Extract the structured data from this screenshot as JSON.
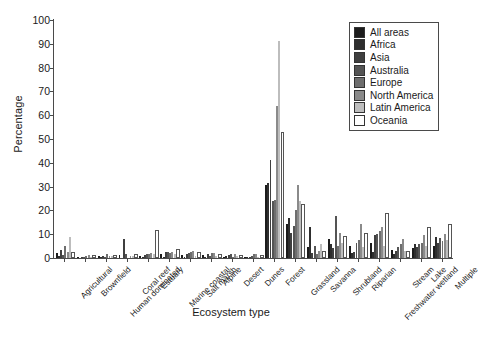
{
  "chart_data": {
    "type": "bar",
    "title": "",
    "xlabel": "Ecosystem type",
    "ylabel": "Percentage",
    "ylim": [
      0,
      100
    ],
    "ytick_step": 10,
    "yticks": [
      0,
      10,
      20,
      30,
      40,
      50,
      60,
      70,
      80,
      90,
      100
    ],
    "grid": false,
    "legend_position": "top-right",
    "categories": [
      "Agricultural",
      "Brownfield",
      "Human dominated",
      "Coral reef",
      "Estuary",
      "Marine coastal",
      "Salt marsh",
      "Alpine",
      "Desert",
      "Dunes",
      "Forest",
      "Grassland",
      "Savanna",
      "Shrubland",
      "Riparian",
      "Freshwater wetland",
      "Stream",
      "Lake",
      "Multiple"
    ],
    "series": [
      {
        "name": "All areas",
        "color": "#1c1c1c",
        "values": [
          2.0,
          0.6,
          0.8,
          1.2,
          1.0,
          1.6,
          1.4,
          1.2,
          0.6,
          0.5,
          30.5,
          14.5,
          4.5,
          8.0,
          5.0,
          6.5,
          3.5,
          4.0,
          5.0
        ]
      },
      {
        "name": "Africa",
        "color": "#2e2e2e",
        "values": [
          1.0,
          0.0,
          0.4,
          0.0,
          0.4,
          0.6,
          0.3,
          0.4,
          1.0,
          0.4,
          31.5,
          17.0,
          13.0,
          6.0,
          2.0,
          2.5,
          1.5,
          6.0,
          9.0
        ]
      },
      {
        "name": "Asia",
        "color": "#3f3f3f",
        "values": [
          3.5,
          0.4,
          0.8,
          8.0,
          1.2,
          2.5,
          1.5,
          1.5,
          1.2,
          0.6,
          41.0,
          10.5,
          2.0,
          4.0,
          2.5,
          9.5,
          3.0,
          4.5,
          6.5
        ]
      },
      {
        "name": "Australia",
        "color": "#545454",
        "values": [
          1.2,
          0.5,
          0.6,
          1.5,
          1.5,
          2.5,
          2.0,
          1.0,
          1.5,
          1.0,
          24.0,
          13.5,
          5.0,
          17.5,
          6.5,
          10.0,
          4.5,
          6.0,
          8.5
        ]
      },
      {
        "name": "Europe",
        "color": "#6e6e6e",
        "values": [
          5.0,
          1.0,
          1.5,
          0.0,
          1.8,
          2.0,
          2.5,
          2.0,
          0.4,
          1.5,
          24.5,
          20.0,
          1.5,
          5.0,
          7.5,
          11.5,
          6.0,
          6.5,
          7.0
        ]
      },
      {
        "name": "North America",
        "color": "#8a8a8a",
        "values": [
          2.5,
          1.2,
          1.0,
          0.8,
          2.2,
          2.5,
          3.0,
          2.0,
          1.5,
          1.5,
          64.0,
          30.5,
          3.0,
          10.5,
          14.5,
          13.0,
          8.0,
          9.5,
          10.0
        ]
      },
      {
        "name": "Latin America",
        "color": "#bdbdbd",
        "values": [
          9.0,
          0.5,
          1.0,
          1.0,
          1.5,
          1.5,
          1.0,
          1.0,
          0.8,
          0.6,
          91.0,
          24.0,
          6.0,
          6.5,
          4.5,
          5.0,
          3.0,
          5.0,
          7.5
        ]
      },
      {
        "name": "Oceania",
        "color": "#ffffff",
        "values": [
          1.5,
          0.4,
          0.6,
          0.8,
          11.0,
          3.0,
          1.5,
          0.8,
          0.6,
          0.5,
          52.0,
          22.0,
          2.0,
          8.5,
          9.5,
          18.0,
          2.0,
          12.0,
          13.5
        ]
      }
    ]
  }
}
